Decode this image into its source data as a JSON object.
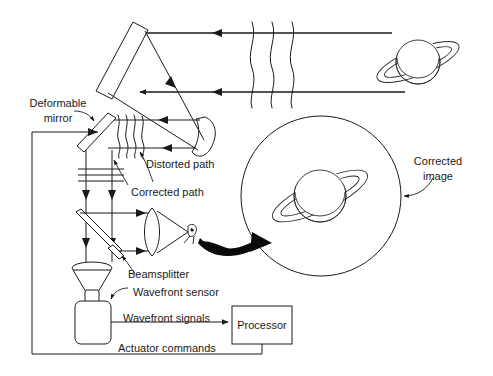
{
  "diagram": {
    "background_color": "#ffffff",
    "line_color": "#1a1a1a"
  },
  "labels": {
    "deformable_mirror_line1": "Deformable",
    "deformable_mirror_line2": "mirror",
    "distorted_path": "Distorted path",
    "corrected_path": "Corrected path",
    "beamsplitter": "Beamsplitter",
    "wavefront_sensor": "Wavefront sensor",
    "wavefront_signals": "Wavefront signals",
    "actuator_commands": "Actuator commands",
    "processor": "Processor",
    "corrected_image_line1": "Corrected",
    "corrected_image_line2": "image"
  },
  "components": {
    "primary_mirror": "primary-mirror",
    "secondary_mirror": "secondary-mirror",
    "deformable_mirror": "deformable-mirror",
    "beamsplitter_upper": "beamsplitter-upper",
    "beamsplitter_lower": "beamsplitter-lower",
    "imaging_lens": "imaging-lens",
    "eye": "eye",
    "funnel": "sensor-funnel",
    "sensor_body": "wavefront-sensor-body",
    "processor_box": "processor-box",
    "source_planet": "source-planet",
    "corrected_image_circle": "corrected-image-circle"
  },
  "wavefronts": {
    "distorted_incoming_count": 3,
    "distorted_internal_count": 4,
    "corrected_flat_count": 3
  }
}
